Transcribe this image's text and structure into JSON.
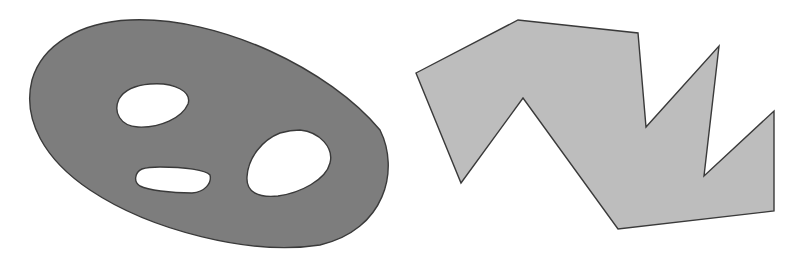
{
  "figure": {
    "width": 802,
    "height": 257,
    "background": "#ffffff",
    "stroke_color": "#3a3a3a",
    "shapes": [
      {
        "name": "region-with-holes",
        "kind": "closed-curve-with-holes",
        "fill": "#7d7d7d",
        "outer_path": "M130,20 C220,16 330,70 380,130 C400,170 385,230 320,245 C250,256 150,230 90,190 C45,160 22,120 32,80 C42,45 80,22 130,20 Z",
        "holes": [
          {
            "name": "hole-upper",
            "path": "M150,84 C175,82 192,92 188,104 C182,118 160,128 138,127 C120,126 113,112 119,99 C125,89 137,85 150,84 Z"
          },
          {
            "name": "hole-lower-left",
            "path": "M160,167 C185,167 206,170 210,175 C212,183 205,192 192,193 C170,193 148,190 140,186 C133,182 135,172 142,169 C148,167 154,167 160,167 Z"
          },
          {
            "name": "hole-right",
            "path": "M300,130 C320,132 334,148 330,163 C326,180 300,193 278,196 C258,198 246,192 247,177 C248,158 262,140 280,133 C287,131 294,130 300,130 Z"
          }
        ]
      },
      {
        "name": "simple-polygon",
        "kind": "polygon",
        "fill": "#bdbdbd",
        "points": [
          [
            416,
            73
          ],
          [
            518,
            20
          ],
          [
            638,
            33
          ],
          [
            646,
            127
          ],
          [
            719,
            46
          ],
          [
            704,
            176
          ],
          [
            774,
            111
          ],
          [
            774,
            211
          ],
          [
            618,
            229
          ],
          [
            523,
            98
          ],
          [
            461,
            183
          ]
        ]
      }
    ]
  }
}
